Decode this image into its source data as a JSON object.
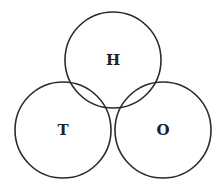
{
  "diagram": {
    "type": "venn",
    "sets": [
      {
        "id": "H",
        "label": "H",
        "cx": 113,
        "cy": 60,
        "r": 48
      },
      {
        "id": "T",
        "label": "T",
        "cx": 63,
        "cy": 130,
        "r": 48
      },
      {
        "id": "O",
        "label": "O",
        "cx": 163,
        "cy": 130,
        "r": 48
      }
    ],
    "stroke_color": "#2b2b2b",
    "background": "#ffffff"
  }
}
